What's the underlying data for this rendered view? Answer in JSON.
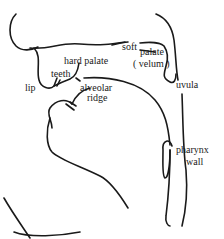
{
  "diagram": {
    "type": "vocal-tract-sagittal-section",
    "line_color": "#1a1a1a",
    "labels": {
      "hard_palate": "hard palate",
      "soft": "soft",
      "palate": "palate",
      "velum": "( velum )",
      "teeth": "teeth",
      "lip": "lip",
      "alveolar": "alveolar",
      "ridge": "ridge",
      "uvula": "uvula",
      "pharynx": "pharynx",
      "wall": "wall"
    }
  }
}
